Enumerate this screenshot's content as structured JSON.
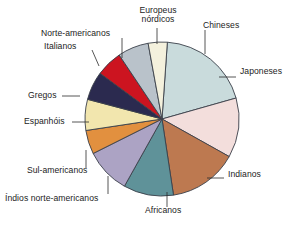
{
  "chart_data": {
    "type": "pie",
    "title": "",
    "subtitle": "",
    "xlabel": "",
    "ylabel": "",
    "legend_position": "none",
    "grid": false,
    "labels_are_leader_lines": true,
    "categories": [
      "Chineses",
      "Japoneses",
      "Indianos",
      "Africanos",
      "Índios norte-americanos",
      "Sul-americanos",
      "Espanhóis",
      "Gregos",
      "Italianos",
      "Norte-americanos",
      "Europeus nórdicos"
    ],
    "values": [
      19.5,
      12.5,
      14.5,
      10.5,
      9.5,
      5.0,
      6.5,
      6.0,
      5.5,
      6.5,
      4.0
    ],
    "value_unit": "percent",
    "colors": [
      "#c9dbdc",
      "#f3dedc",
      "#bd7950",
      "#5f9299",
      "#aca3c4",
      "#e2903f",
      "#f2e6ae",
      "#2b2a4f",
      "#cc1420",
      "#b9c2ca",
      "#f4f1dd"
    ],
    "slices": [
      {
        "label": "Chineses",
        "value": 19.5,
        "color": "#c9dbdc"
      },
      {
        "label": "Japoneses",
        "value": 12.5,
        "color": "#f3dedc"
      },
      {
        "label": "Indianos",
        "value": 14.5,
        "color": "#bd7950"
      },
      {
        "label": "Africanos",
        "value": 10.5,
        "color": "#5f9299"
      },
      {
        "label": "Índios norte-americanos",
        "value": 9.5,
        "color": "#aca3c4"
      },
      {
        "label": "Sul-americanos",
        "value": 5.0,
        "color": "#e2903f"
      },
      {
        "label": "Espanhóis",
        "value": 6.5,
        "color": "#f2e6ae"
      },
      {
        "label": "Gregos",
        "value": 6.0,
        "color": "#2b2a4f"
      },
      {
        "label": "Italianos",
        "value": 5.5,
        "color": "#cc1420"
      },
      {
        "label": "Norte-americanos",
        "value": 6.5,
        "color": "#b9c2ca"
      },
      {
        "label": "Europeus nórdicos",
        "value": 4.0,
        "color": "#f4f1dd"
      }
    ]
  },
  "labels": {
    "europeus_nordicos_line1": "Europeus",
    "europeus_nordicos_line2": "nórdicos",
    "chineses": "Chineses",
    "japoneses": "Japoneses",
    "indianos": "Indianos",
    "africanos": "Africanos",
    "indios_norte_americanos": "Índios norte-americanos",
    "sul_americanos": "Sul-americanos",
    "espanhois": "Espanhóis",
    "gregos": "Gregos",
    "italianos": "Italianos",
    "norte_americanos": "Norte-americanos"
  },
  "caption": {
    "text": ""
  }
}
